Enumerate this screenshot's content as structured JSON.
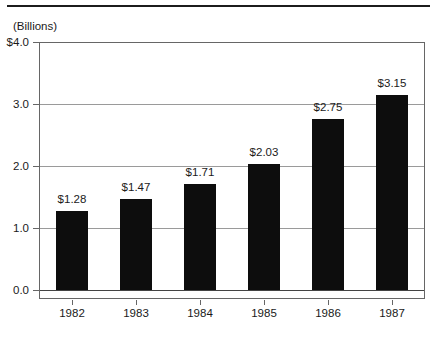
{
  "chart_data": {
    "type": "bar",
    "title": "",
    "unit_label": "(Billions)",
    "categories": [
      "1982",
      "1983",
      "1984",
      "1985",
      "1986",
      "1987"
    ],
    "values": [
      1.28,
      1.47,
      1.71,
      2.03,
      2.75,
      3.15
    ],
    "bar_labels": [
      "$1.28",
      "$1.47",
      "$1.71",
      "$2.03",
      "$2.75",
      "$3.15"
    ],
    "xlabel": "",
    "ylabel": "",
    "ylim": [
      0,
      4
    ],
    "y_ticks": [
      {
        "value": 4.0,
        "label": "$4.0"
      },
      {
        "value": 3.0,
        "label": "3.0"
      },
      {
        "value": 2.0,
        "label": "2.0"
      },
      {
        "value": 1.0,
        "label": "1.0"
      },
      {
        "value": 0.0,
        "label": "0.0"
      }
    ],
    "grid": "horizontal",
    "legend": "none",
    "colors": {
      "bar": "#0d0d0d",
      "gridline": "#9a9a9a",
      "frame": "#666666",
      "baseline": "#444444",
      "top_rule": "#1c1c1c",
      "text": "#1a1a1a",
      "background": "#ffffff"
    }
  }
}
